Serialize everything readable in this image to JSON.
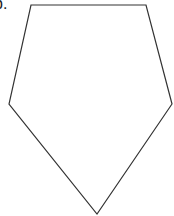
{
  "figure": {
    "label": "b.",
    "shape": "pentagon",
    "stroke_color": "#333333",
    "fill_color": "#ffffff",
    "stroke_width": 1.2,
    "vertices": [
      {
        "name": "top-left",
        "x": 31,
        "y": 5
      },
      {
        "name": "top-right",
        "x": 146,
        "y": 5
      },
      {
        "name": "right",
        "x": 172,
        "y": 104
      },
      {
        "name": "bottom",
        "x": 97,
        "y": 214
      },
      {
        "name": "left",
        "x": 9,
        "y": 104
      }
    ]
  }
}
